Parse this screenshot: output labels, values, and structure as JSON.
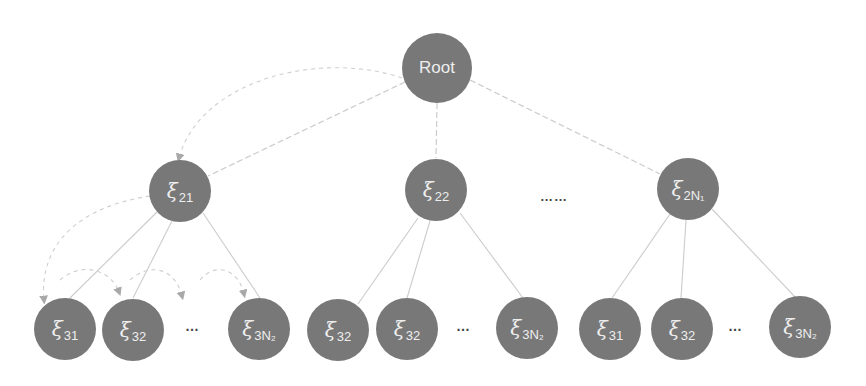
{
  "diagram": {
    "type": "tree",
    "colors": {
      "node_fill": "#787878",
      "node_text": "#eeeeee",
      "edge": "#c8c8c8",
      "dashed_arrow": "#c0c0c0"
    },
    "root": {
      "label": "Root"
    },
    "level2": [
      {
        "symbol": "ξ",
        "sub": "21"
      },
      {
        "symbol": "ξ",
        "sub": "22"
      },
      {
        "symbol": "ξ",
        "sub": "2N₁"
      }
    ],
    "level2_ellipsis": "……",
    "level3": [
      {
        "symbol": "ξ",
        "sub": "31"
      },
      {
        "symbol": "ξ",
        "sub": "32"
      },
      {
        "symbol": "ξ",
        "sub": "3N₂"
      },
      {
        "symbol": "ξ",
        "sub": "32"
      },
      {
        "symbol": "ξ",
        "sub": "32"
      },
      {
        "symbol": "ξ",
        "sub": "3N₂"
      },
      {
        "symbol": "ξ",
        "sub": "31"
      },
      {
        "symbol": "ξ",
        "sub": "32"
      },
      {
        "symbol": "ξ",
        "sub": "3N₂"
      }
    ],
    "level3_ellipsis": "…"
  }
}
